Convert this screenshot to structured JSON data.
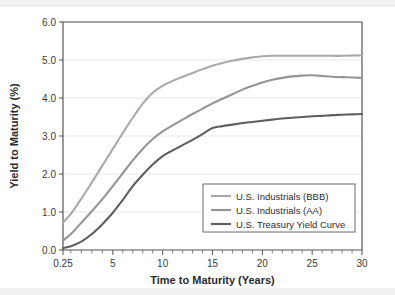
{
  "figure": {
    "background_color": "#ffffff",
    "band_color": "#f0f0f0"
  },
  "chart_data": {
    "type": "line",
    "title": "",
    "xlabel": "Time to Maturity (Years)",
    "ylabel": "Yield to Maturity (%)",
    "xlim": [
      0.25,
      30
    ],
    "ylim": [
      0.0,
      6.0
    ],
    "grid": true,
    "legend_position": "lower right",
    "x_tick_labels": [
      "0.25",
      "5",
      "10",
      "15",
      "20",
      "25",
      "30"
    ],
    "x_tick_values": [
      0.25,
      5,
      10,
      15,
      20,
      25,
      30
    ],
    "y_tick_labels": [
      "0.0",
      "1.0",
      "2.0",
      "3.0",
      "4.0",
      "5.0",
      "6.0"
    ],
    "y_tick_values": [
      0.0,
      1.0,
      2.0,
      3.0,
      4.0,
      5.0,
      6.0
    ],
    "x": [
      0.25,
      1,
      2,
      3,
      4,
      5,
      6,
      7,
      8,
      9,
      10,
      11,
      12,
      13,
      14,
      15,
      16,
      17,
      18,
      19,
      20,
      21,
      22,
      23,
      24,
      25,
      26,
      27,
      28,
      29,
      30
    ],
    "series": [
      {
        "name": "U.S. Industrials (BBB)",
        "color": "#a9a9a9",
        "values": [
          0.72,
          0.95,
          1.35,
          1.78,
          2.22,
          2.66,
          3.08,
          3.48,
          3.85,
          4.14,
          4.32,
          4.45,
          4.56,
          4.66,
          4.76,
          4.85,
          4.92,
          4.98,
          5.03,
          5.07,
          5.1,
          5.11,
          5.11,
          5.11,
          5.11,
          5.11,
          5.11,
          5.11,
          5.11,
          5.12,
          5.12
        ]
      },
      {
        "name": "U.S. Industrials (AA)",
        "color": "#959595",
        "values": [
          0.25,
          0.42,
          0.72,
          1.02,
          1.34,
          1.68,
          2.02,
          2.36,
          2.66,
          2.92,
          3.12,
          3.28,
          3.43,
          3.58,
          3.72,
          3.86,
          3.98,
          4.1,
          4.22,
          4.32,
          4.41,
          4.48,
          4.53,
          4.57,
          4.59,
          4.6,
          4.58,
          4.56,
          4.55,
          4.54,
          4.53
        ]
      },
      {
        "name": "U.S. Treasury Yield Curve",
        "color": "#5f5f5f",
        "values": [
          0.05,
          0.1,
          0.22,
          0.42,
          0.68,
          0.98,
          1.32,
          1.68,
          1.98,
          2.25,
          2.47,
          2.62,
          2.76,
          2.9,
          3.05,
          3.21,
          3.26,
          3.3,
          3.34,
          3.37,
          3.4,
          3.43,
          3.46,
          3.48,
          3.5,
          3.52,
          3.53,
          3.55,
          3.56,
          3.57,
          3.58
        ]
      }
    ]
  }
}
